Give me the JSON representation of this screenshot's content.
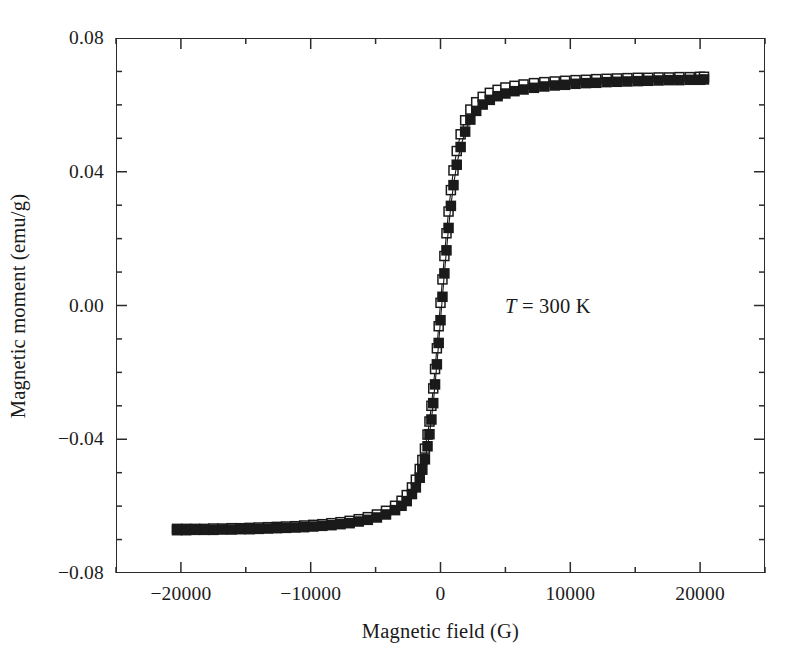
{
  "chart_data": {
    "type": "scatter",
    "title": "",
    "xlabel": "Magnetic field (G)",
    "ylabel": "Magnetic moment (emu/g)",
    "xlim": [
      -25000,
      25000
    ],
    "ylim": [
      -0.08,
      0.08
    ],
    "grid": false,
    "legend": "none",
    "x_major_ticks": [
      -20000,
      -10000,
      0,
      10000,
      20000
    ],
    "x_major_tick_labels": [
      "−20000",
      "−10000",
      "0",
      "10000",
      "20000"
    ],
    "x_minor_tick_step": 5000,
    "y_major_ticks": [
      -0.08,
      -0.04,
      0.0,
      0.04,
      0.08
    ],
    "y_major_tick_labels": [
      "−0.08",
      "−0.04",
      "0.00",
      "0.04",
      "0.08"
    ],
    "y_minor_tick_step": 0.01,
    "ticks_direction": "in",
    "frame": "box",
    "annotations": [
      {
        "text_symbol": "T",
        "text_rest": " = 300 K",
        "x": 9000,
        "y": 0.0,
        "italic_symbol": true
      }
    ],
    "series": [
      {
        "name": "branch-open",
        "marker": "open-square",
        "marker_size": 9,
        "color": "#1a1a1a",
        "fill": "#ffffff",
        "line": true,
        "points": [
          [
            -20300,
            -0.0668
          ],
          [
            -19600,
            -0.0668
          ],
          [
            -18900,
            -0.0668
          ],
          [
            -18200,
            -0.0668
          ],
          [
            -17500,
            -0.0667
          ],
          [
            -16800,
            -0.0667
          ],
          [
            -16100,
            -0.0666
          ],
          [
            -15400,
            -0.0666
          ],
          [
            -14700,
            -0.0665
          ],
          [
            -14000,
            -0.0664
          ],
          [
            -13300,
            -0.0663
          ],
          [
            -12600,
            -0.0662
          ],
          [
            -11900,
            -0.0661
          ],
          [
            -11200,
            -0.066
          ],
          [
            -10500,
            -0.0658
          ],
          [
            -9800,
            -0.0656
          ],
          [
            -9100,
            -0.0654
          ],
          [
            -8400,
            -0.0651
          ],
          [
            -7700,
            -0.0648
          ],
          [
            -7000,
            -0.0644
          ],
          [
            -6300,
            -0.0639
          ],
          [
            -5600,
            -0.0633
          ],
          [
            -4900,
            -0.0625
          ],
          [
            -4200,
            -0.0614
          ],
          [
            -3500,
            -0.0599
          ],
          [
            -3000,
            -0.0584
          ],
          [
            -2600,
            -0.0567
          ],
          [
            -2200,
            -0.0544
          ],
          [
            -1900,
            -0.0521
          ],
          [
            -1600,
            -0.0489
          ],
          [
            -1400,
            -0.0462
          ],
          [
            -1200,
            -0.0428
          ],
          [
            -1000,
            -0.0386
          ],
          [
            -850,
            -0.0347
          ],
          [
            -700,
            -0.03
          ],
          [
            -560,
            -0.0248
          ],
          [
            -420,
            -0.019
          ],
          [
            -280,
            -0.0128
          ],
          [
            -140,
            -0.0062
          ],
          [
            0,
            0.0008
          ],
          [
            150,
            0.0078
          ],
          [
            300,
            0.0148
          ],
          [
            460,
            0.0216
          ],
          [
            620,
            0.0281
          ],
          [
            800,
            0.0345
          ],
          [
            1000,
            0.0404
          ],
          [
            1250,
            0.0462
          ],
          [
            1550,
            0.0512
          ],
          [
            1900,
            0.0554
          ],
          [
            2300,
            0.0586
          ],
          [
            2750,
            0.0608
          ],
          [
            3250,
            0.0624
          ],
          [
            3800,
            0.0636
          ],
          [
            4400,
            0.0645
          ],
          [
            5000,
            0.0652
          ],
          [
            5700,
            0.0657
          ],
          [
            6400,
            0.0661
          ],
          [
            7200,
            0.0665
          ],
          [
            8000,
            0.0668
          ],
          [
            8800,
            0.067
          ],
          [
            9600,
            0.0672
          ],
          [
            10400,
            0.0674
          ],
          [
            11200,
            0.0675
          ],
          [
            12000,
            0.0677
          ],
          [
            12800,
            0.0678
          ],
          [
            13600,
            0.0679
          ],
          [
            14400,
            0.068
          ],
          [
            15200,
            0.0681
          ],
          [
            16000,
            0.0681
          ],
          [
            16800,
            0.0682
          ],
          [
            17600,
            0.0682
          ],
          [
            18400,
            0.0683
          ],
          [
            19200,
            0.0683
          ],
          [
            20000,
            0.0684
          ],
          [
            20300,
            0.0684
          ]
        ]
      },
      {
        "name": "branch-filled",
        "marker": "filled-square",
        "marker_size": 9,
        "color": "#1a1a1a",
        "fill": "#1a1a1a",
        "line": true,
        "points": [
          [
            -20300,
            -0.0672
          ],
          [
            -19600,
            -0.0672
          ],
          [
            -18900,
            -0.0671
          ],
          [
            -18200,
            -0.0671
          ],
          [
            -17500,
            -0.0671
          ],
          [
            -16800,
            -0.067
          ],
          [
            -16100,
            -0.067
          ],
          [
            -15400,
            -0.0669
          ],
          [
            -14700,
            -0.0669
          ],
          [
            -14000,
            -0.0668
          ],
          [
            -13300,
            -0.0667
          ],
          [
            -12600,
            -0.0666
          ],
          [
            -11900,
            -0.0665
          ],
          [
            -11200,
            -0.0664
          ],
          [
            -10500,
            -0.0663
          ],
          [
            -9800,
            -0.0661
          ],
          [
            -9100,
            -0.0659
          ],
          [
            -8400,
            -0.0657
          ],
          [
            -7700,
            -0.0654
          ],
          [
            -7000,
            -0.0651
          ],
          [
            -6300,
            -0.0646
          ],
          [
            -5600,
            -0.0641
          ],
          [
            -4900,
            -0.0634
          ],
          [
            -4200,
            -0.0625
          ],
          [
            -3500,
            -0.0612
          ],
          [
            -3000,
            -0.0599
          ],
          [
            -2600,
            -0.0585
          ],
          [
            -2200,
            -0.0564
          ],
          [
            -1900,
            -0.0544
          ],
          [
            -1600,
            -0.0515
          ],
          [
            -1400,
            -0.0491
          ],
          [
            -1200,
            -0.046
          ],
          [
            -1000,
            -0.0421
          ],
          [
            -850,
            -0.0385
          ],
          [
            -700,
            -0.0341
          ],
          [
            -560,
            -0.0292
          ],
          [
            -420,
            -0.0236
          ],
          [
            -280,
            -0.0176
          ],
          [
            -140,
            -0.0112
          ],
          [
            0,
            -0.0044
          ],
          [
            150,
            0.0026
          ],
          [
            300,
            0.0096
          ],
          [
            460,
            0.0165
          ],
          [
            620,
            0.0232
          ],
          [
            800,
            0.0298
          ],
          [
            1000,
            0.036
          ],
          [
            1250,
            0.0421
          ],
          [
            1550,
            0.0474
          ],
          [
            1900,
            0.052
          ],
          [
            2300,
            0.0556
          ],
          [
            2750,
            0.0582
          ],
          [
            3250,
            0.0601
          ],
          [
            3800,
            0.0615
          ],
          [
            4400,
            0.0626
          ],
          [
            5000,
            0.0634
          ],
          [
            5700,
            0.0641
          ],
          [
            6400,
            0.0646
          ],
          [
            7200,
            0.0651
          ],
          [
            8000,
            0.0655
          ],
          [
            8800,
            0.0658
          ],
          [
            9600,
            0.066
          ],
          [
            10400,
            0.0663
          ],
          [
            11200,
            0.0665
          ],
          [
            12000,
            0.0666
          ],
          [
            12800,
            0.0668
          ],
          [
            13600,
            0.0669
          ],
          [
            14400,
            0.067
          ],
          [
            15200,
            0.0671
          ],
          [
            16000,
            0.0672
          ],
          [
            16800,
            0.0673
          ],
          [
            17600,
            0.0674
          ],
          [
            18400,
            0.0674
          ],
          [
            19200,
            0.0675
          ],
          [
            20000,
            0.0675
          ],
          [
            20300,
            0.0676
          ]
        ]
      }
    ]
  }
}
